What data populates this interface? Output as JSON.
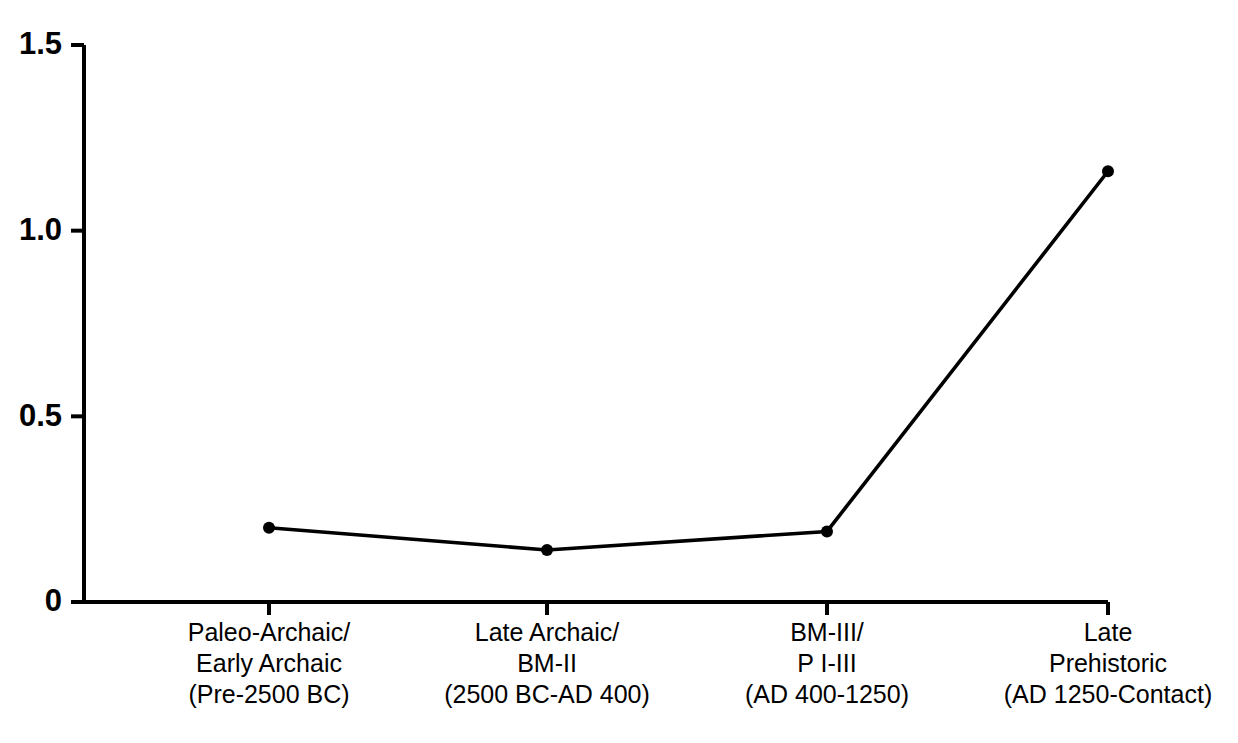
{
  "chart_data": {
    "type": "line",
    "title": "",
    "subtitle": "",
    "xlabel": "",
    "ylabel": "",
    "categories": [
      "Paleo-Archaic/\nEarly Archaic\n(Pre-2500 BC)",
      "Late Archaic/\nBM-II\n(2500 BC-AD 400)",
      "BM-III/\nP I-III\n(AD 400-1250)",
      "Late\nPrehistoric\n(AD 1250-Contact)"
    ],
    "category_lines": [
      [
        "Paleo-Archaic/",
        "Early Archaic",
        "(Pre-2500 BC)"
      ],
      [
        "Late Archaic/",
        "BM-II",
        "(2500 BC-AD 400)"
      ],
      [
        "BM-III/",
        "P I-III",
        "(AD 400-1250)"
      ],
      [
        "Late",
        "Prehistoric",
        "(AD 1250-Contact)"
      ]
    ],
    "values": [
      0.2,
      0.14,
      0.19,
      1.16
    ],
    "ylim": [
      0,
      1.5
    ],
    "ytick_values": [
      0,
      0.5,
      1.0,
      1.5
    ],
    "ytick_labels": [
      "0",
      "0.5",
      "1.0",
      "1.5"
    ],
    "grid": false,
    "legend": null,
    "legend_position": "none",
    "series": [
      {
        "name": "",
        "values": [
          0.2,
          0.14,
          0.19,
          1.16
        ]
      }
    ],
    "marker": "filled-circle",
    "line_color": "#000000",
    "marker_color": "#000000",
    "background_color": "#ffffff"
  }
}
